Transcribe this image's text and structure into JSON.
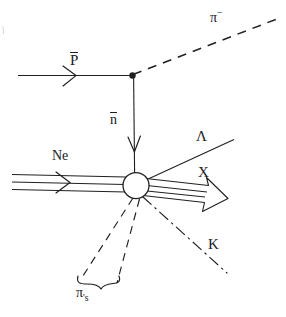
{
  "figure": {
    "type": "particle-interaction-diagram",
    "background_color": "#ffffff",
    "ink_color": "#20201f"
  },
  "labels": {
    "pi_minus": "π",
    "pi_minus_charge": "−",
    "pbar": "P",
    "nbar": "n",
    "neon": "Ne",
    "lambda": "Λ",
    "x": "X",
    "kaon": "K",
    "pions": "π",
    "pions_suffix": "'s"
  },
  "tracks": [
    {
      "name": "antiproton-beam",
      "label": "P̄",
      "style": "solid",
      "from": [
        18,
        75
      ],
      "to": [
        132,
        75
      ],
      "arrow": "mid-chevron"
    },
    {
      "name": "pi-minus-track",
      "label": "π−",
      "style": "dashed",
      "from": [
        132,
        75
      ],
      "to": [
        276,
        20
      ],
      "arrow": "none"
    },
    {
      "name": "antineutron-track",
      "label": "n̄",
      "style": "solid",
      "from": [
        132,
        75
      ],
      "to": [
        134,
        172
      ],
      "arrow": "end-open-v"
    },
    {
      "name": "neon-beam",
      "label": "Ne",
      "style": "triple-solid",
      "from": [
        12,
        176
      ],
      "to": [
        124,
        186
      ],
      "arrow": "mid-chevron"
    },
    {
      "name": "lambda-track",
      "label": "Λ",
      "style": "solid",
      "from": [
        147,
        180
      ],
      "to": [
        232,
        141
      ],
      "arrow": "none"
    },
    {
      "name": "x-track",
      "label": "X",
      "style": "hollow-arrow",
      "from": [
        148,
        187
      ],
      "to": [
        227,
        199
      ],
      "arrow": "hollow-head"
    },
    {
      "name": "kaon-track",
      "label": "K",
      "style": "dash-dot",
      "from": [
        142,
        198
      ],
      "to": [
        226,
        272
      ],
      "arrow": "none"
    },
    {
      "name": "pion-track-left",
      "label": "π's",
      "style": "dashed",
      "from": [
        134,
        198
      ],
      "to": [
        83,
        277
      ],
      "arrow": "none"
    },
    {
      "name": "pion-track-right",
      "label": "π's",
      "style": "dashed",
      "from": [
        139,
        199
      ],
      "to": [
        118,
        281
      ],
      "arrow": "none"
    }
  ],
  "vertices": [
    {
      "name": "charge-exchange-vertex",
      "shape": "filled-dot",
      "x": 132,
      "y": 75,
      "r": 3
    },
    {
      "name": "annihilation-vertex",
      "shape": "open-circle",
      "x": 136,
      "y": 185,
      "r": 13
    }
  ],
  "annotations": [
    {
      "name": "pion-group-brace",
      "type": "curly-brace",
      "spans": "pion-track-left to pion-track-right",
      "label": "π's"
    }
  ]
}
